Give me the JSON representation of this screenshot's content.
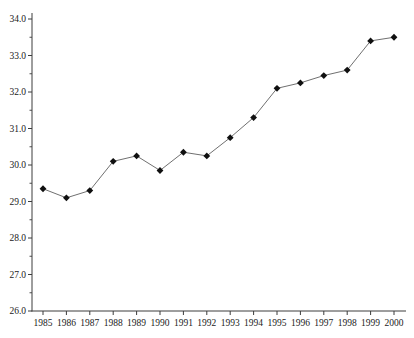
{
  "chart_data": {
    "type": "line",
    "title": "",
    "xlabel": "",
    "ylabel": "",
    "x_labels": [
      "1985",
      "1986",
      "1987",
      "1988",
      "1989",
      "1990",
      "1991",
      "1992",
      "1993",
      "1994",
      "1995",
      "1996",
      "1997",
      "1998",
      "1999",
      "2000"
    ],
    "series": [
      {
        "name": "series-1",
        "values": [
          29.35,
          29.1,
          29.3,
          30.1,
          30.25,
          29.85,
          30.35,
          30.25,
          30.75,
          31.3,
          32.1,
          32.25,
          32.45,
          32.6,
          33.4,
          33.5
        ]
      }
    ],
    "ylim": [
      26.0,
      34.0
    ],
    "ytick_step": 1.0,
    "yminor_tick_step": 0.5,
    "ytick_decimals": 1,
    "grid": false,
    "legend": "none",
    "marker": "diamond",
    "colors": {
      "line": "#707070",
      "marker": "#101010",
      "axis": "#3c3c3c",
      "tick_label": "#1a1a1a",
      "background": "#ffffff"
    }
  }
}
